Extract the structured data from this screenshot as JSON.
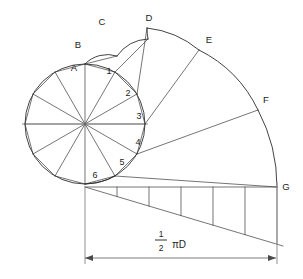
{
  "diagram": {
    "canvas": {
      "width": 303,
      "height": 279,
      "background": "#ffffff"
    },
    "colors": {
      "line": "#3a3a3a",
      "arc": "#2e2e2e",
      "dimension": "#6f6f6f",
      "extension": "#9a9a9a",
      "axis": "#8d8d8d",
      "text": "#1c1c1c"
    },
    "base_circle": {
      "center_x": 85,
      "center_y": 124,
      "radius": 60,
      "divisions": 12
    },
    "outer_labels": [
      {
        "text": "A",
        "x": 74,
        "y": 68
      },
      {
        "text": "B",
        "x": 78,
        "y": 45
      },
      {
        "text": "C",
        "x": 102,
        "y": 22
      },
      {
        "text": "D",
        "x": 149,
        "y": 18
      },
      {
        "text": "E",
        "x": 209,
        "y": 40
      },
      {
        "text": "F",
        "x": 266,
        "y": 100
      },
      {
        "text": "G",
        "x": 286,
        "y": 187
      }
    ],
    "inner_labels": [
      {
        "text": "1",
        "x": 109,
        "y": 72
      },
      {
        "text": "2",
        "x": 128,
        "y": 94
      },
      {
        "text": "3",
        "x": 139,
        "y": 117
      },
      {
        "text": "4",
        "x": 138,
        "y": 143
      },
      {
        "text": "5",
        "x": 122,
        "y": 163
      },
      {
        "text": "6",
        "x": 95,
        "y": 176
      }
    ],
    "baseline": {
      "y": 187,
      "x_start": 85,
      "x_end": 277,
      "tick_count": 6,
      "tick_spacing": 32,
      "tick_first_x": 117
    },
    "hypotenuse": {
      "x_start": 85,
      "y_start": 187,
      "x_end": 283,
      "y_end": 246
    },
    "dimension": {
      "y": 258,
      "x_start": 85,
      "x_end": 276,
      "label_fraction_numerator": "1",
      "label_fraction_denominator": "2",
      "label_suffix": "πD",
      "label_plain": "1/2 πD",
      "label_x": 170,
      "label_y": 240
    }
  }
}
